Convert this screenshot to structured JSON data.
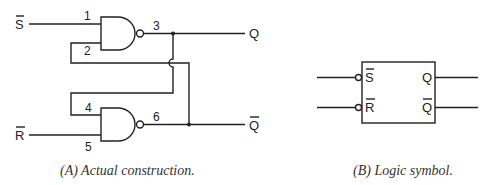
{
  "diagram": {
    "type": "SR latch (NAND)",
    "panel_a": {
      "caption": "(A) Actual construction.",
      "inputs": {
        "set": "S",
        "reset": "R"
      },
      "outputs": {
        "q": "Q",
        "q_not": "Q"
      },
      "pins": {
        "p1": "1",
        "p2": "2",
        "p3": "3",
        "p4": "4",
        "p5": "5",
        "p6": "6"
      },
      "gates": [
        "nand-gate-upper",
        "nand-gate-lower"
      ]
    },
    "panel_b": {
      "caption": "(B) Logic symbol.",
      "inputs": {
        "set": "S",
        "reset": "R"
      },
      "outputs": {
        "q": "Q",
        "q_not": "Q"
      }
    }
  }
}
